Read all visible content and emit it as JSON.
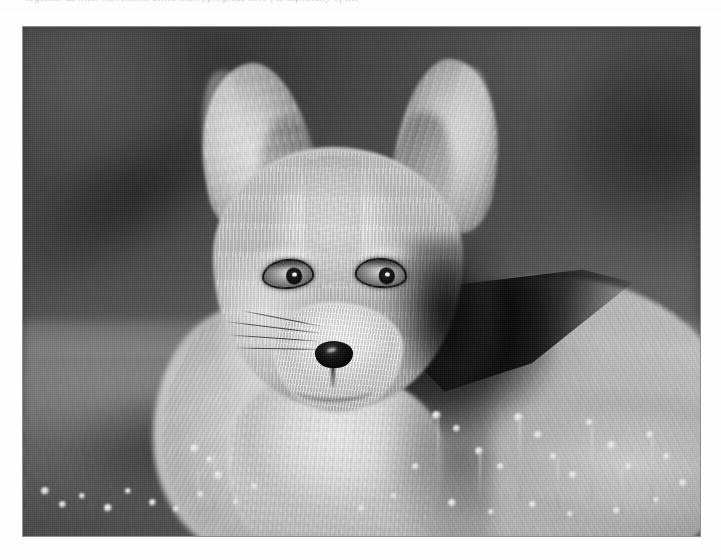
{
  "page": {
    "background_color": "#fefefe",
    "width": 721,
    "height": 560
  },
  "caption": {
    "text": "together as their movement. Since then , progress here , is especially of the",
    "note": "clipped line of italic serif text at top of page, only descenders visible",
    "color": "#9aa0ab"
  },
  "photo": {
    "alt_title": "Young red fox standing in grass",
    "border_color": "#8e8e8e",
    "frame": {
      "x": 22,
      "y": 26,
      "width": 679,
      "height": 511
    },
    "rendering": "black-and-white photograph",
    "subject": "red fox kit",
    "background_description": "blurred dark grey out-of-focus field",
    "foreground_description": "blurred grass with small white wildflowers",
    "colors": {
      "background_dark": "#474747",
      "background_light": "#747474",
      "ground_mid": "#6d6d6d",
      "fur_light": "#f0f0f0",
      "fur_mid": "#c2c2c2",
      "fur_shadow": "#6e6e6e",
      "nose_black": "#060606",
      "shoulder_patch": "#0a0a0a"
    },
    "features": [
      {
        "name": "left-ear",
        "x": 178,
        "y": 36,
        "width": 112,
        "height": 168
      },
      {
        "name": "right-ear",
        "x": 372,
        "y": 32,
        "width": 104,
        "height": 172
      },
      {
        "name": "head",
        "x": 190,
        "y": 120,
        "width": 250,
        "height": 260
      },
      {
        "name": "left-eye",
        "x": 241,
        "y": 234,
        "width": 48,
        "height": 26
      },
      {
        "name": "right-eye",
        "x": 334,
        "y": 233,
        "width": 48,
        "height": 26
      },
      {
        "name": "nose",
        "x": 292,
        "y": 314,
        "width": 38,
        "height": 27
      },
      {
        "name": "muzzle",
        "x": 250,
        "y": 275,
        "width": 130,
        "height": 110
      },
      {
        "name": "chest",
        "x": 205,
        "y": 345,
        "width": 215,
        "height": 195
      },
      {
        "name": "body",
        "x": 300,
        "y": 250,
        "width": 420,
        "height": 300
      },
      {
        "name": "dark-shoulder-patch",
        "x": 380,
        "y": 240,
        "width": 230,
        "height": 130
      }
    ],
    "flowers": [
      {
        "x": 40,
        "y": 486,
        "size": 8
      },
      {
        "x": 58,
        "y": 500,
        "size": 7
      },
      {
        "x": 78,
        "y": 492,
        "size": 6
      },
      {
        "x": 103,
        "y": 503,
        "size": 8
      },
      {
        "x": 124,
        "y": 487,
        "size": 6
      },
      {
        "x": 148,
        "y": 498,
        "size": 7
      },
      {
        "x": 172,
        "y": 505,
        "size": 6
      },
      {
        "x": 196,
        "y": 490,
        "size": 7
      },
      {
        "x": 213,
        "y": 470,
        "size": 9
      },
      {
        "x": 232,
        "y": 498,
        "size": 6
      },
      {
        "x": 250,
        "y": 482,
        "size": 7
      },
      {
        "x": 189,
        "y": 443,
        "size": 9
      },
      {
        "x": 205,
        "y": 455,
        "size": 7
      },
      {
        "x": 431,
        "y": 410,
        "size": 9
      },
      {
        "x": 452,
        "y": 424,
        "size": 7
      },
      {
        "x": 474,
        "y": 446,
        "size": 8
      },
      {
        "x": 496,
        "y": 462,
        "size": 7
      },
      {
        "x": 513,
        "y": 412,
        "size": 9
      },
      {
        "x": 533,
        "y": 430,
        "size": 8
      },
      {
        "x": 549,
        "y": 452,
        "size": 7
      },
      {
        "x": 568,
        "y": 470,
        "size": 8
      },
      {
        "x": 585,
        "y": 418,
        "size": 7
      },
      {
        "x": 606,
        "y": 440,
        "size": 9
      },
      {
        "x": 624,
        "y": 462,
        "size": 7
      },
      {
        "x": 645,
        "y": 430,
        "size": 8
      },
      {
        "x": 662,
        "y": 452,
        "size": 7
      },
      {
        "x": 678,
        "y": 478,
        "size": 8
      },
      {
        "x": 411,
        "y": 462,
        "size": 7
      },
      {
        "x": 390,
        "y": 492,
        "size": 6
      },
      {
        "x": 357,
        "y": 504,
        "size": 7
      },
      {
        "x": 447,
        "y": 498,
        "size": 8
      },
      {
        "x": 487,
        "y": 508,
        "size": 6
      },
      {
        "x": 528,
        "y": 500,
        "size": 7
      },
      {
        "x": 566,
        "y": 510,
        "size": 6
      },
      {
        "x": 612,
        "y": 506,
        "size": 7
      },
      {
        "x": 652,
        "y": 496,
        "size": 6
      }
    ],
    "stems": [
      {
        "x": 212,
        "y": 452,
        "height": 58
      },
      {
        "x": 196,
        "y": 470,
        "height": 44
      },
      {
        "x": 436,
        "y": 418,
        "height": 70
      },
      {
        "x": 518,
        "y": 420,
        "height": 78
      },
      {
        "x": 590,
        "y": 426,
        "height": 72
      },
      {
        "x": 650,
        "y": 438,
        "height": 64
      },
      {
        "x": 478,
        "y": 452,
        "height": 54
      },
      {
        "x": 556,
        "y": 458,
        "height": 50
      },
      {
        "x": 620,
        "y": 468,
        "height": 46
      }
    ]
  }
}
